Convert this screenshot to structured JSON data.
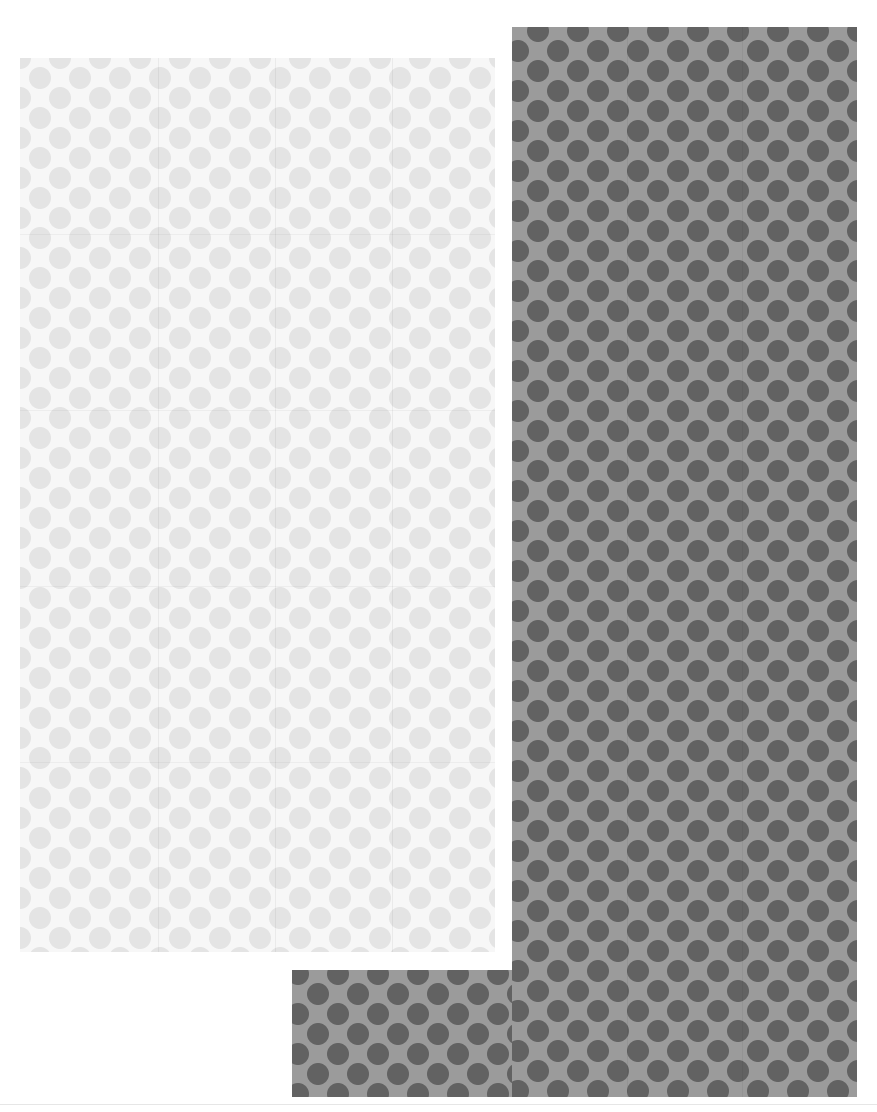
{
  "scene": {
    "description": "Two polka-dot patterned paper swatches on a white background",
    "background_color": "#ffffff",
    "swatches": [
      {
        "name": "light-swatch",
        "base_color": "#f7f7f7",
        "dot_color": "#e4e4e4",
        "x": 20,
        "y": 58,
        "width": 475,
        "height": 894
      },
      {
        "name": "dark-swatch-vertical",
        "base_color": "#9b9b9b",
        "dot_color": "#626262",
        "x": 512,
        "y": 27,
        "width": 345,
        "height": 1070
      },
      {
        "name": "dark-swatch-horizontal",
        "base_color": "#9b9b9b",
        "dot_color": "#626262",
        "x": 292,
        "y": 970,
        "width": 565,
        "height": 127
      }
    ],
    "pattern": {
      "type": "polka-dot",
      "dot_diameter_px": 22,
      "spacing_px": 40,
      "arrangement": "staggered"
    }
  }
}
